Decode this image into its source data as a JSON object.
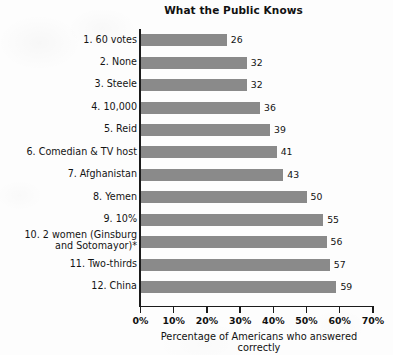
{
  "chart_data": {
    "type": "bar",
    "orientation": "horizontal",
    "title": "What the Public Knows",
    "xlabel": "Percentage of Americans who answered correctly",
    "ylabel": "",
    "xlim": [
      0,
      70
    ],
    "grid": false,
    "legend": null,
    "xtick_labels": [
      "0%",
      "10%",
      "20%",
      "30%",
      "40%",
      "50%",
      "60%",
      "70%"
    ],
    "xtick_values": [
      0,
      10,
      20,
      30,
      40,
      50,
      60,
      70
    ],
    "bar_color": "#8a8a8a",
    "categories": [
      "1. 60 votes",
      "2. None",
      "3. Steele",
      "4. 10,000",
      "5. Reid",
      "6. Comedian & TV host",
      "7. Afghanistan",
      "8. Yemen",
      "9. 10%",
      "10. 2 women (Ginsburg\nand Sotomayor)*",
      "11. Two-thirds",
      "12. China"
    ],
    "values": [
      26,
      32,
      32,
      36,
      39,
      41,
      43,
      50,
      55,
      56,
      57,
      59
    ],
    "value_labels": [
      "26",
      "32",
      "32",
      "36",
      "39",
      "41",
      "43",
      "50",
      "55",
      "56",
      "57",
      "59"
    ]
  }
}
